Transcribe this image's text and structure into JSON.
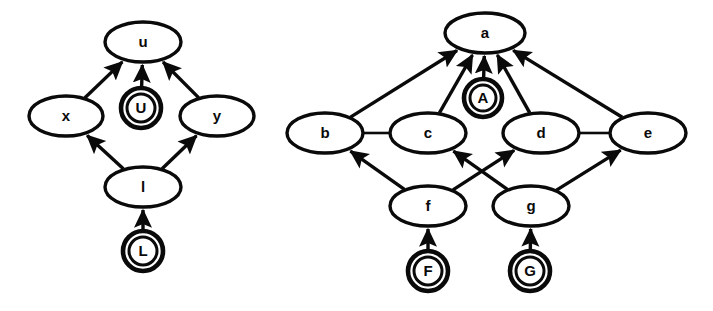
{
  "figure": {
    "background_color": "#ffffff",
    "stroke_color": "#0a0a0a",
    "width": 713,
    "height": 311
  },
  "diagrams": [
    {
      "id": "left-graph",
      "name": "lower-bound-lattice",
      "nodes": [
        {
          "id": "u",
          "label": "u",
          "shape": "ellipse",
          "cx": 143,
          "cy": 42,
          "rx": 38,
          "ry": 20
        },
        {
          "id": "x",
          "label": "x",
          "shape": "ellipse",
          "cx": 66,
          "cy": 116,
          "rx": 37,
          "ry": 20
        },
        {
          "id": "U",
          "label": "U",
          "shape": "double-circle",
          "cx": 141,
          "cy": 108,
          "r": 20,
          "r_inner": 14
        },
        {
          "id": "y",
          "label": "y",
          "shape": "ellipse",
          "cx": 217,
          "cy": 116,
          "rx": 37,
          "ry": 20
        },
        {
          "id": "l",
          "label": "l",
          "shape": "ellipse",
          "cx": 143,
          "cy": 187,
          "rx": 38,
          "ry": 20
        },
        {
          "id": "L",
          "label": "L",
          "shape": "double-circle",
          "cx": 143,
          "cy": 251,
          "r": 20,
          "r_inner": 14
        }
      ],
      "edges": [
        {
          "from": "x",
          "to": "u",
          "arrow": true
        },
        {
          "from": "U",
          "to": "u",
          "arrow": true
        },
        {
          "from": "y",
          "to": "u",
          "arrow": true
        },
        {
          "from": "l",
          "to": "x",
          "arrow": true
        },
        {
          "from": "l",
          "to": "y",
          "arrow": true
        },
        {
          "from": "L",
          "to": "l",
          "arrow": true
        }
      ]
    },
    {
      "id": "right-graph",
      "name": "upper-bound-lattice",
      "nodes": [
        {
          "id": "a",
          "label": "a",
          "shape": "ellipse",
          "cx": 485,
          "cy": 33,
          "rx": 40,
          "ry": 20
        },
        {
          "id": "A",
          "label": "A",
          "shape": "double-circle",
          "cx": 483,
          "cy": 98,
          "r": 19,
          "r_inner": 13
        },
        {
          "id": "b",
          "label": "b",
          "shape": "ellipse",
          "cx": 325,
          "cy": 133,
          "rx": 38,
          "ry": 20
        },
        {
          "id": "c",
          "label": "c",
          "shape": "ellipse",
          "cx": 428,
          "cy": 133,
          "rx": 38,
          "ry": 20
        },
        {
          "id": "d",
          "label": "d",
          "shape": "ellipse",
          "cx": 541,
          "cy": 133,
          "rx": 38,
          "ry": 20
        },
        {
          "id": "e",
          "label": "e",
          "shape": "ellipse",
          "cx": 648,
          "cy": 133,
          "rx": 38,
          "ry": 20
        },
        {
          "id": "f",
          "label": "f",
          "shape": "ellipse",
          "cx": 428,
          "cy": 206,
          "rx": 38,
          "ry": 20
        },
        {
          "id": "g",
          "label": "g",
          "shape": "ellipse",
          "cx": 531,
          "cy": 206,
          "rx": 38,
          "ry": 20
        },
        {
          "id": "F",
          "label": "F",
          "shape": "double-circle",
          "cx": 428,
          "cy": 271,
          "r": 20,
          "r_inner": 14
        },
        {
          "id": "G",
          "label": "G",
          "shape": "double-circle",
          "cx": 530,
          "cy": 271,
          "r": 20,
          "r_inner": 14
        }
      ],
      "edges": [
        {
          "from": "b",
          "to": "a",
          "arrow": true
        },
        {
          "from": "c",
          "to": "a",
          "arrow": true
        },
        {
          "from": "A",
          "to": "a",
          "arrow": true
        },
        {
          "from": "d",
          "to": "a",
          "arrow": true
        },
        {
          "from": "e",
          "to": "a",
          "arrow": true
        },
        {
          "from": "b",
          "to": "c",
          "arrow": false
        },
        {
          "from": "d",
          "to": "e",
          "arrow": false
        },
        {
          "from": "f",
          "to": "b",
          "arrow": true
        },
        {
          "from": "f",
          "to": "d",
          "arrow": true
        },
        {
          "from": "g",
          "to": "c",
          "arrow": true
        },
        {
          "from": "g",
          "to": "e",
          "arrow": true
        },
        {
          "from": "F",
          "to": "f",
          "arrow": true
        },
        {
          "from": "G",
          "to": "g",
          "arrow": true
        }
      ]
    }
  ]
}
